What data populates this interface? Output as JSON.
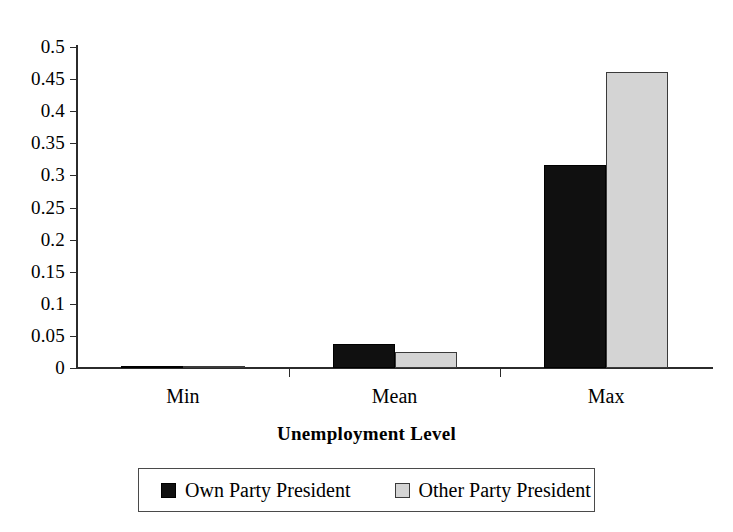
{
  "chart_data": {
    "type": "bar",
    "title": "",
    "xlabel": "Unemployment Level",
    "ylabel": "",
    "categories": [
      "Min",
      "Mean",
      "Max"
    ],
    "series": [
      {
        "name": "Own Party President",
        "values": [
          0.002,
          0.037,
          0.317
        ],
        "color": "#101010"
      },
      {
        "name": "Other Party President",
        "values": [
          0.001,
          0.025,
          0.461
        ],
        "color": "#d4d4d4"
      }
    ],
    "ylim": [
      0,
      0.5
    ],
    "ytick_labels": [
      "0",
      "0.05",
      "0.1",
      "0.15",
      "0.2",
      "0.25",
      "0.3",
      "0.35",
      "0.4",
      "0.45",
      "0.5"
    ],
    "ytick_values": [
      0,
      0.05,
      0.1,
      0.15,
      0.2,
      0.25,
      0.3,
      0.35,
      0.4,
      0.45,
      0.5
    ],
    "grid": false,
    "legend_position": "bottom"
  }
}
